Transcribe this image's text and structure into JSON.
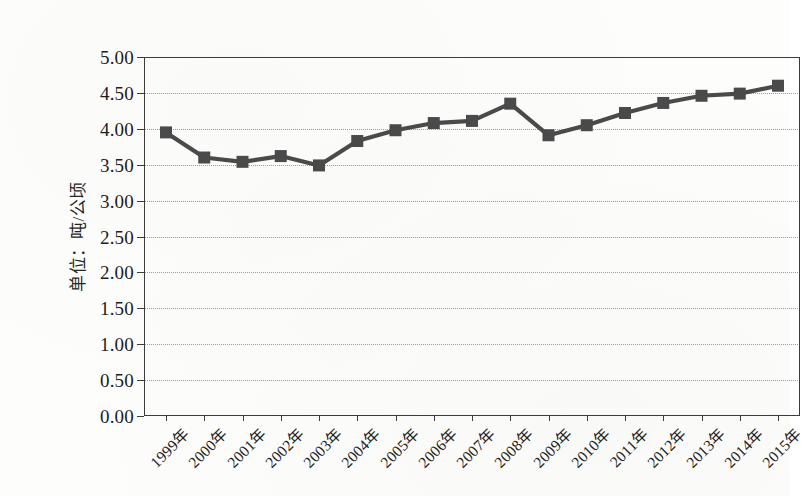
{
  "chart_data": {
    "type": "line",
    "title": "",
    "xlabel": "",
    "ylabel": "单位：吨/公顷",
    "categories": [
      "1999年",
      "2000年",
      "2001年",
      "2002年",
      "2003年",
      "2004年",
      "2005年",
      "2006年",
      "2007年",
      "2008年",
      "2009年",
      "2010年",
      "2011年",
      "2012年",
      "2013年",
      "2014年",
      "2015年"
    ],
    "values": [
      3.95,
      3.6,
      3.54,
      3.62,
      3.49,
      3.83,
      3.98,
      4.08,
      4.11,
      4.35,
      3.91,
      4.05,
      4.22,
      4.36,
      4.46,
      4.49,
      4.6
    ],
    "series": [
      {
        "name": "单位面积产量",
        "values": [
          3.95,
          3.6,
          3.54,
          3.62,
          3.49,
          3.83,
          3.98,
          4.08,
          4.11,
          4.35,
          3.91,
          4.05,
          4.22,
          4.36,
          4.46,
          4.49,
          4.6
        ]
      }
    ],
    "ylim": [
      0.0,
      5.0
    ],
    "ytick_step": 0.5,
    "ytick_labels": [
      "0.00",
      "0.50",
      "1.00",
      "1.50",
      "2.00",
      "2.50",
      "3.00",
      "3.50",
      "4.00",
      "4.50",
      "5.00"
    ],
    "ytick_values": [
      0.0,
      0.5,
      1.0,
      1.5,
      2.0,
      2.5,
      3.0,
      3.5,
      4.0,
      4.5,
      5.0
    ],
    "grid": true,
    "grid_axis": "y",
    "grid_style": "dotted",
    "legend": "none",
    "marker": "square",
    "series_color": "#4a4a4a",
    "grid_color": "#9a9a9a",
    "axis_color": "#3c3c3c",
    "x_label_rotation": -45
  }
}
